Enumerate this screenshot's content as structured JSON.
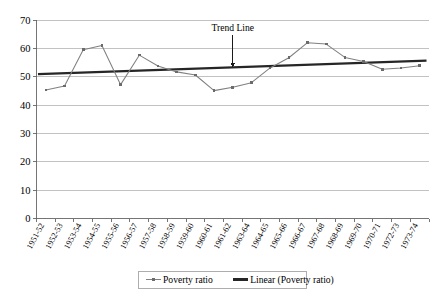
{
  "chart_data": {
    "type": "line",
    "title": "",
    "xlabel": "",
    "ylabel": "",
    "ylim": [
      0,
      70
    ],
    "ytick_step": 10,
    "grid": true,
    "legend_position": "bottom",
    "categories": [
      "1951-52",
      "1952-53",
      "1953-54",
      "1954-55",
      "1955-56",
      "1956-57",
      "1957-58",
      "1958-59",
      "1959-60",
      "1960-61",
      "1961-62",
      "1963-64",
      "1964-65",
      "1965-66",
      "1966-67",
      "1967-68",
      "1968-69",
      "1969-70",
      "1970-71",
      "1972-73",
      "1973-74"
    ],
    "yticks": [
      "0",
      "10",
      "20",
      "30",
      "40",
      "50",
      "60",
      "70"
    ],
    "series": [
      {
        "name": "Poverty ratio",
        "type": "line-marker",
        "color": "#808080",
        "values": [
          45.3,
          46.7,
          59.5,
          61.0,
          47.2,
          57.6,
          53.8,
          51.7,
          50.6,
          45.1,
          46.3,
          47.9,
          53.1,
          56.7,
          62.0,
          61.5,
          56.8,
          55.4,
          52.6,
          53.1,
          53.9
        ]
      },
      {
        "name": "Linear (Poverty ratio)",
        "type": "trend",
        "color": "#262626",
        "start_value": 50.9,
        "end_value": 55.7
      }
    ],
    "annotations": [
      {
        "text": "Trend Line",
        "category_index": 10,
        "value": 66.0,
        "arrow": "down",
        "arrow_target_value": 53.3
      }
    ],
    "legend": [
      {
        "label": "Poverty ratio",
        "marker": "line-marker",
        "color": "#808080"
      },
      {
        "label": "Linear (Poverty ratio)",
        "marker": "thick-line",
        "color": "#262626"
      }
    ]
  }
}
